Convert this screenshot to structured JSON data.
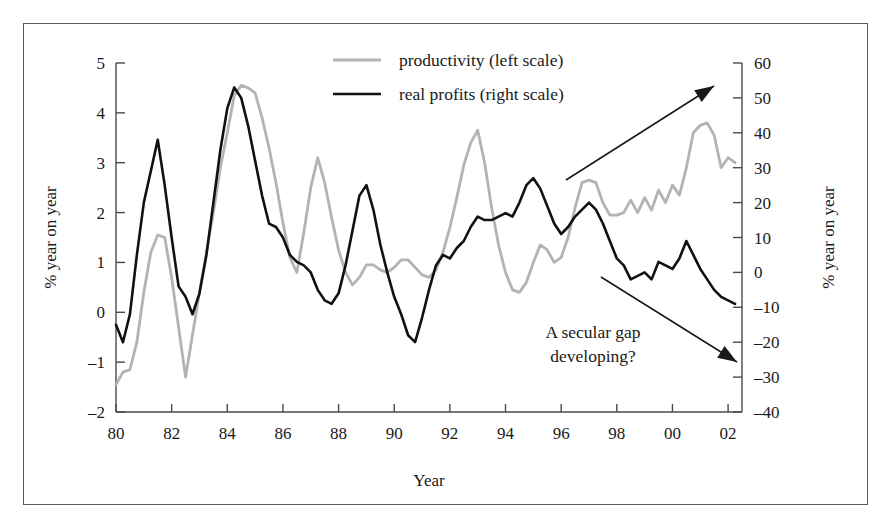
{
  "figure": {
    "background": "#ffffff",
    "border_color": "#5a5a5a"
  },
  "legend": {
    "position": "top-center",
    "items": [
      {
        "label": "productivity (left scale)",
        "color": "#b3b3b3",
        "style": "solid"
      },
      {
        "label": "real profits (right scale)",
        "color": "#111111",
        "style": "solid"
      }
    ]
  },
  "annotations": {
    "gap_text_line1": "A secular gap",
    "gap_text_line2": "developing?",
    "arrow_up_name": "productivity-trend-arrow",
    "arrow_down_name": "profits-trend-arrow"
  },
  "chart_data": {
    "type": "line",
    "title": "",
    "subtitle": "",
    "xlabel": "Year",
    "ylabel": "% year on year",
    "ylabel_right": "% year on year",
    "grid": false,
    "legend_position": "top-center",
    "xlim": [
      1980.0,
      2002.5
    ],
    "xticks": [
      1980,
      1982,
      1984,
      1986,
      1988,
      1990,
      1992,
      1994,
      1996,
      1998,
      2000,
      2002
    ],
    "xtick_labels": [
      "80",
      "82",
      "84",
      "86",
      "88",
      "90",
      "92",
      "94",
      "96",
      "98",
      "00",
      "02"
    ],
    "ylim": [
      -2,
      5
    ],
    "yticks": [
      -2,
      -1,
      0,
      1,
      2,
      3,
      4,
      5
    ],
    "ytick_labels": [
      "-2",
      "-1",
      "0",
      "1",
      "2",
      "3",
      "4",
      "5"
    ],
    "ylim_right": [
      -40,
      60
    ],
    "yticks_right": [
      -40,
      -30,
      -20,
      -10,
      0,
      10,
      20,
      30,
      40,
      50,
      60
    ],
    "ytick_labels_right": [
      "-40",
      "-30",
      "-20",
      "-10",
      "0",
      "10",
      "20",
      "30",
      "40",
      "50",
      "60"
    ],
    "series": [
      {
        "name": "productivity (left scale)",
        "axis": "left",
        "color": "#b3b3b3",
        "x": [
          1980.0,
          1980.25,
          1980.5,
          1980.75,
          1981.0,
          1981.25,
          1981.5,
          1981.75,
          1982.0,
          1982.25,
          1982.5,
          1982.75,
          1983.0,
          1983.25,
          1983.5,
          1983.75,
          1984.0,
          1984.25,
          1984.5,
          1984.75,
          1985.0,
          1985.25,
          1985.5,
          1985.75,
          1986.0,
          1986.25,
          1986.5,
          1986.75,
          1987.0,
          1987.25,
          1987.5,
          1987.75,
          1988.0,
          1988.25,
          1988.5,
          1988.75,
          1989.0,
          1989.25,
          1989.5,
          1989.75,
          1990.0,
          1990.25,
          1990.5,
          1990.75,
          1991.0,
          1991.25,
          1991.5,
          1991.75,
          1992.0,
          1992.25,
          1992.5,
          1992.75,
          1993.0,
          1993.25,
          1993.5,
          1993.75,
          1994.0,
          1994.25,
          1994.5,
          1994.75,
          1995.0,
          1995.25,
          1995.5,
          1995.75,
          1996.0,
          1996.25,
          1996.5,
          1996.75,
          1997.0,
          1997.25,
          1997.5,
          1997.75,
          1998.0,
          1998.25,
          1998.5,
          1998.75,
          1999.0,
          1999.25,
          1999.5,
          1999.75,
          2000.0,
          2000.25,
          2000.5,
          2000.75,
          2001.0,
          2001.25,
          2001.5,
          2001.75,
          2002.0,
          2002.25
        ],
        "y": [
          -1.45,
          -1.2,
          -1.15,
          -0.6,
          0.4,
          1.2,
          1.55,
          1.5,
          0.7,
          -0.3,
          -1.3,
          -0.45,
          0.4,
          1.2,
          2.0,
          2.9,
          3.6,
          4.35,
          4.55,
          4.5,
          4.4,
          3.9,
          3.3,
          2.6,
          1.8,
          1.1,
          0.8,
          1.6,
          2.5,
          3.1,
          2.6,
          1.9,
          1.25,
          0.8,
          0.55,
          0.7,
          0.95,
          0.95,
          0.85,
          0.8,
          0.9,
          1.05,
          1.05,
          0.9,
          0.75,
          0.7,
          0.85,
          1.2,
          1.7,
          2.3,
          2.95,
          3.4,
          3.65,
          3.0,
          2.1,
          1.35,
          0.8,
          0.45,
          0.4,
          0.6,
          1.0,
          1.35,
          1.25,
          1.0,
          1.1,
          1.5,
          2.1,
          2.6,
          2.65,
          2.6,
          2.2,
          1.95,
          1.95,
          2.0,
          2.25,
          2.0,
          2.3,
          2.05,
          2.45,
          2.2,
          2.55,
          2.35,
          2.9,
          3.6,
          3.75,
          3.8,
          3.55,
          2.9,
          3.1,
          3.0
        ]
      },
      {
        "name": "real profits (right scale)",
        "axis": "right",
        "color": "#111111",
        "x": [
          1980.0,
          1980.25,
          1980.5,
          1980.75,
          1981.0,
          1981.25,
          1981.5,
          1981.75,
          1982.0,
          1982.25,
          1982.5,
          1982.75,
          1983.0,
          1983.25,
          1983.5,
          1983.75,
          1984.0,
          1984.25,
          1984.5,
          1984.75,
          1985.0,
          1985.25,
          1985.5,
          1985.75,
          1986.0,
          1986.25,
          1986.5,
          1986.75,
          1987.0,
          1987.25,
          1987.5,
          1987.75,
          1988.0,
          1988.25,
          1988.5,
          1988.75,
          1989.0,
          1989.25,
          1989.5,
          1989.75,
          1990.0,
          1990.25,
          1990.5,
          1990.75,
          1991.0,
          1991.25,
          1991.5,
          1991.75,
          1992.0,
          1992.25,
          1992.5,
          1992.75,
          1993.0,
          1993.25,
          1993.5,
          1993.75,
          1994.0,
          1994.25,
          1994.5,
          1994.75,
          1995.0,
          1995.25,
          1995.5,
          1995.75,
          1996.0,
          1996.25,
          1996.5,
          1996.75,
          1997.0,
          1997.25,
          1997.5,
          1997.75,
          1998.0,
          1998.25,
          1998.5,
          1998.75,
          1999.0,
          1999.25,
          1999.5,
          1999.75,
          2000.0,
          2000.25,
          2000.5,
          2000.75,
          2001.0,
          2001.25,
          2001.5,
          2001.75,
          2002.0,
          2002.25
        ],
        "y": [
          -15,
          -20,
          -12,
          5,
          20,
          29,
          38,
          25,
          10,
          -4,
          -7,
          -12,
          -6,
          5,
          20,
          35,
          47,
          53,
          50,
          42,
          32,
          22,
          14,
          13,
          10,
          5,
          3,
          2,
          0,
          -5,
          -8,
          -9,
          -6,
          2,
          12,
          22,
          25,
          18,
          8,
          0,
          -7,
          -12,
          -18,
          -20,
          -13,
          -5,
          2,
          5,
          4,
          7,
          9,
          13,
          16,
          15,
          15,
          16,
          17,
          16,
          20,
          25,
          27,
          24,
          19,
          14,
          11,
          13,
          16,
          18,
          20,
          18,
          14,
          9,
          4,
          2,
          -2,
          -1,
          0,
          -2,
          3,
          2,
          1,
          4,
          9,
          5,
          1,
          -2,
          -5,
          -7,
          -8,
          -9
        ]
      }
    ]
  }
}
